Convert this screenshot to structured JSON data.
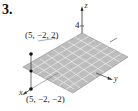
{
  "problem": {
    "number": "3."
  },
  "diagram": {
    "type": "3d-plane",
    "axes": {
      "x_label": "x",
      "y_label": "y",
      "z_label": "z",
      "z_tick": "4"
    },
    "points": [
      {
        "label": "(5, −2, 2)"
      },
      {
        "label": "(5, −2, −2)"
      }
    ],
    "colors": {
      "plane_fill": "#bdbdbd",
      "grid_line": "#f2f2f2",
      "axis": "#333333",
      "point": "#111111"
    }
  }
}
